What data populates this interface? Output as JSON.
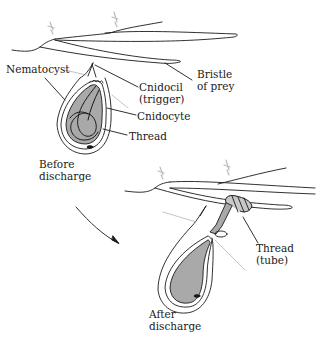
{
  "figure": {
    "colors": {
      "line": "#1a1a1a",
      "capsule_fill": "#a9a9a9",
      "leader_light": "#9a9a9a",
      "background": "#ffffff"
    }
  },
  "before": {
    "caption_line1": "Before",
    "caption_line2": "discharge",
    "labels": {
      "nematocyst": "Nematocyst",
      "cnidocil_line1": "Cnidocil",
      "cnidocil_line2": "(trigger)",
      "bristle_line1": "Bristle",
      "bristle_line2": "of prey",
      "cnidocyte": "Cnidocyte",
      "thread": "Thread"
    }
  },
  "after": {
    "caption_line1": "After",
    "caption_line2": "discharge",
    "labels": {
      "thread_line1": "Thread",
      "thread_line2": "(tube)"
    }
  },
  "arrow": {
    "direction": "before-to-after"
  }
}
